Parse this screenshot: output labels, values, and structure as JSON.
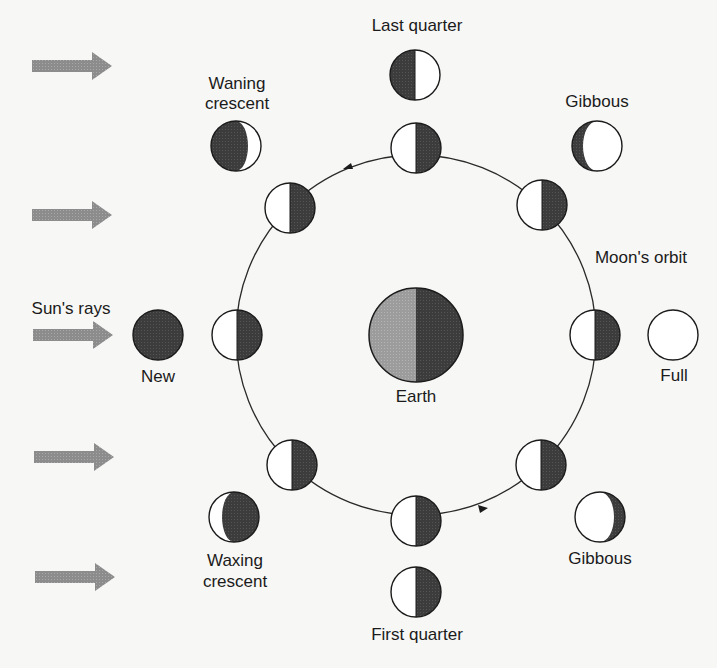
{
  "diagram": {
    "colors": {
      "background": "#f7f7f5",
      "dark": "#3a3a3a",
      "light": "#ffffff",
      "earth_lit": "#9a9a9a",
      "ray": "#8e8e8e",
      "stroke": "#1b1b1b"
    },
    "labels": {
      "sun_rays": "Sun's rays",
      "earth": "Earth",
      "moons_orbit": "Moon's orbit",
      "new": "New",
      "full": "Full",
      "last_quarter": "Last quarter",
      "first_quarter": "First quarter",
      "waning_crescent_1": "Waning",
      "waning_crescent_2": "crescent",
      "waxing_crescent_1": "Waxing",
      "waxing_crescent_2": "crescent",
      "gibbous_upper": "Gibbous",
      "gibbous_lower": "Gibbous"
    },
    "nodes": [
      {
        "id": "earth",
        "label": "Earth"
      },
      {
        "id": "moon-orbit-left",
        "phase": "half-lit (sunward side lit)"
      },
      {
        "id": "moon-orbit-upper-left",
        "phase": "half-lit"
      },
      {
        "id": "moon-orbit-top",
        "phase": "half-lit"
      },
      {
        "id": "moon-orbit-upper-right",
        "phase": "half-lit"
      },
      {
        "id": "moon-orbit-right",
        "phase": "half-lit"
      },
      {
        "id": "moon-orbit-lower-right",
        "phase": "half-lit"
      },
      {
        "id": "moon-orbit-bottom",
        "phase": "half-lit"
      },
      {
        "id": "moon-orbit-lower-left",
        "phase": "half-lit"
      },
      {
        "id": "view-new",
        "label": "New"
      },
      {
        "id": "view-waning-crescent",
        "label": "Waning crescent"
      },
      {
        "id": "view-last-quarter",
        "label": "Last quarter"
      },
      {
        "id": "view-gibbous-upper",
        "label": "Gibbous"
      },
      {
        "id": "view-full",
        "label": "Full"
      },
      {
        "id": "view-gibbous-lower",
        "label": "Gibbous"
      },
      {
        "id": "view-first-quarter",
        "label": "First quarter"
      },
      {
        "id": "view-waxing-crescent",
        "label": "Waxing crescent"
      }
    ],
    "edges": [
      {
        "from": "sun",
        "to": "moon",
        "label": "Sun's rays",
        "count": 5
      },
      {
        "orbit": "Moon's orbit",
        "direction": "counterclockwise"
      }
    ]
  }
}
